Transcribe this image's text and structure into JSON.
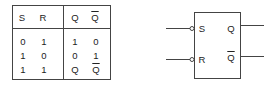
{
  "truth_table": {
    "headers": [
      "S",
      "R",
      "Q",
      "Q̄"
    ],
    "header_overline": [
      false,
      false,
      false,
      true
    ],
    "rows": [
      [
        "0",
        "1",
        "1",
        "0"
      ],
      [
        "1",
        "0",
        "0",
        "1"
      ],
      [
        "1",
        "1",
        "Q",
        "Q"
      ]
    ],
    "rows_overline": [
      [
        false,
        false,
        false,
        false
      ],
      [
        false,
        false,
        false,
        false
      ],
      [
        false,
        false,
        false,
        true
      ]
    ]
  },
  "flip_flop": {
    "inputs": [
      {
        "label": "S",
        "inverted": true
      },
      {
        "label": "R",
        "inverted": true
      }
    ],
    "outputs": [
      {
        "label": "Q",
        "overline": false
      },
      {
        "label": "Q",
        "overline": true
      }
    ]
  }
}
